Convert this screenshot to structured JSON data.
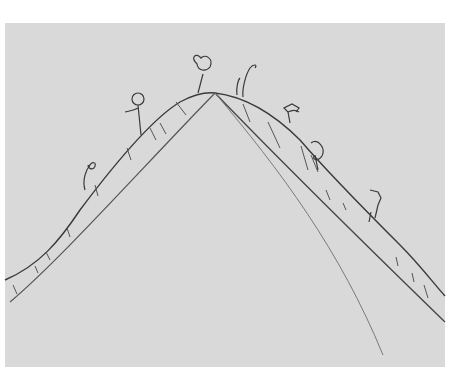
{
  "image": {
    "description": "Hand-drawn pencil sketch on paper of a mountain with small stick figures climbing along the ridgeline",
    "colors": {
      "background": "#ffffff",
      "paper": "#d9d9d9",
      "ink": "#3a3a3a",
      "light_pencil": "#7a7a7a"
    }
  }
}
